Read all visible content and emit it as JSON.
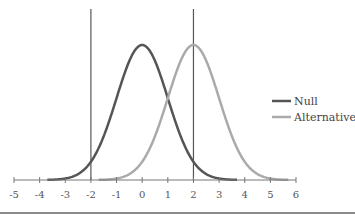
{
  "chart_data": {
    "type": "line",
    "title": "",
    "xlabel": "",
    "ylabel": "",
    "xlim": [
      -5,
      6
    ],
    "x_ticks": [
      -5,
      -4,
      -3,
      -2,
      -1,
      0,
      1,
      2,
      3,
      4,
      5,
      6
    ],
    "x_tick_labels": [
      "-5",
      "-4",
      "-3",
      "-2",
      "-1",
      "0",
      "1",
      "2",
      "3",
      "4",
      "5",
      "6"
    ],
    "grid": false,
    "legend_position": "right",
    "vertical_lines": [
      -2,
      2
    ],
    "series": [
      {
        "name": "Null",
        "distribution": "normal",
        "mean": 0,
        "sd": 1,
        "color": "#555555",
        "x": [
          -4,
          -3,
          -2,
          -1,
          0,
          1,
          2,
          3,
          4
        ],
        "values": [
          0.0001,
          0.0044,
          0.054,
          0.242,
          0.399,
          0.242,
          0.054,
          0.0044,
          0.0001
        ]
      },
      {
        "name": "Alternative",
        "distribution": "normal",
        "mean": 2,
        "sd": 1,
        "color": "#aaaaaa",
        "x": [
          -2,
          -1,
          0,
          1,
          2,
          3,
          4,
          5,
          6
        ],
        "values": [
          0.0001,
          0.0044,
          0.054,
          0.242,
          0.399,
          0.242,
          0.054,
          0.0044,
          0.0001
        ]
      }
    ]
  },
  "legend": {
    "items": [
      {
        "label": "Null",
        "color": "#555555"
      },
      {
        "label": "Alternative",
        "color": "#aaaaaa"
      }
    ]
  }
}
